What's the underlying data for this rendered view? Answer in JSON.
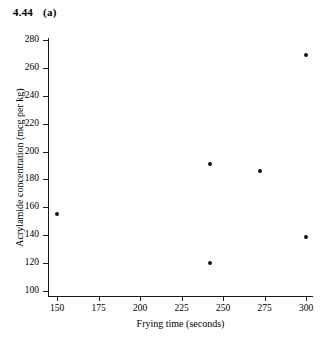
{
  "figure": {
    "label_number": "4.44",
    "label_part": "(a)"
  },
  "chart_data": {
    "type": "scatter",
    "xlabel": "Frying time (seconds)",
    "ylabel": "Acrylamide concentration (mcg per kg)",
    "xlim": [
      150,
      300
    ],
    "ylim": [
      100,
      280
    ],
    "xticks": [
      150,
      175,
      200,
      225,
      250,
      275,
      300
    ],
    "yticks": [
      100,
      120,
      140,
      160,
      180,
      200,
      220,
      240,
      260,
      280
    ],
    "grid": false,
    "legend": "none",
    "marker_color": "#141414",
    "x": [
      150,
      242,
      242,
      272,
      300,
      300
    ],
    "y": [
      155,
      191,
      120,
      186,
      269,
      139
    ],
    "points": [
      {
        "x": 150,
        "y": 155
      },
      {
        "x": 242,
        "y": 191
      },
      {
        "x": 242,
        "y": 120
      },
      {
        "x": 272,
        "y": 186
      },
      {
        "x": 300,
        "y": 269
      },
      {
        "x": 300,
        "y": 139
      }
    ]
  }
}
